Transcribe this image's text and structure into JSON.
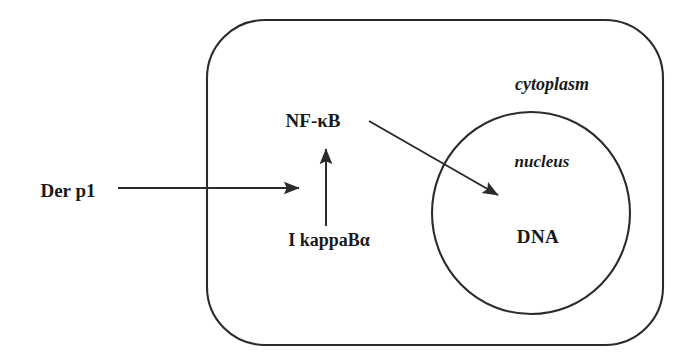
{
  "figure": {
    "type": "biological-pathway-diagram",
    "background_color": "#ffffff",
    "stroke_color": "#2b2b2b",
    "text_color": "#1a1a1a",
    "width": 687,
    "height": 359
  },
  "compartments": [
    {
      "id": "cell",
      "label": "cytoplasm",
      "shape": "rounded-rectangle",
      "x": 207,
      "y": 20,
      "width": 456,
      "height": 325,
      "corner_radius": 58
    },
    {
      "id": "nucleus",
      "label": "nucleus",
      "shape": "ellipse",
      "cx": 531,
      "cy": 213,
      "rx": 99,
      "ry": 101
    }
  ],
  "labels": {
    "stimulus": "Der p1",
    "transcription_factor": "NF-κB",
    "inhibitor": "I kappaBα",
    "cytoplasm": "cytoplasm",
    "nucleus": "nucleus",
    "dna": "DNA"
  },
  "arrows": [
    {
      "id": "der-p1-to-cell",
      "from": "Der p1",
      "to": "cell interior",
      "direction": "right",
      "x1": 118,
      "y1": 188,
      "x2": 300,
      "y2": 188
    },
    {
      "id": "ikappab-to-nfkb",
      "from": "I kappaBα",
      "to": "NF-κB",
      "direction": "up",
      "x1": 326,
      "y1": 226,
      "x2": 326,
      "y2": 145
    },
    {
      "id": "nfkb-to-dna",
      "from": "NF-κB",
      "to": "DNA",
      "direction": "down-right",
      "x1": 369,
      "y1": 121,
      "x2": 501,
      "y2": 197
    }
  ]
}
